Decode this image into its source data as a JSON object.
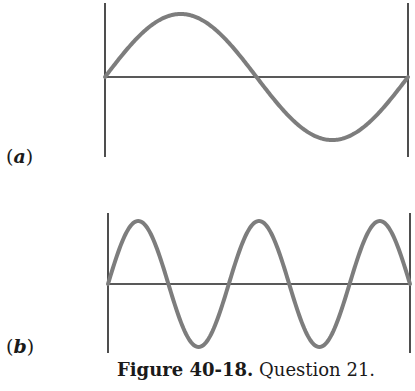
{
  "figure": {
    "caption_number": "Figure 40-18.",
    "caption_text": " Question 21.",
    "colors": {
      "wave": "#7d7d7d",
      "axis": "#222222",
      "text": "#1a1a1a",
      "background": "#ffffff"
    },
    "panels": [
      {
        "id": "a",
        "label_open": "(",
        "label_letter": "a",
        "label_close": ")",
        "description": "Standing wave between two walls: one full wavelength (half cycles: 2)",
        "half_cycles": 2,
        "wall_left_x": 105,
        "wall_right_x": 408,
        "wall_top_y": 3,
        "wall_bottom_y": 157,
        "baseline_y": 77,
        "amplitude": 63
      },
      {
        "id": "b",
        "label_open": "(",
        "label_letter": "b",
        "label_close": ")",
        "description": "Standing wave between two walls: two and a half wavelengths (half cycles: 5)",
        "half_cycles": 5,
        "wall_left_x": 108,
        "wall_right_x": 410,
        "wall_top_y": 213,
        "wall_bottom_y": 353,
        "baseline_y": 284,
        "amplitude": 63
      }
    ]
  }
}
